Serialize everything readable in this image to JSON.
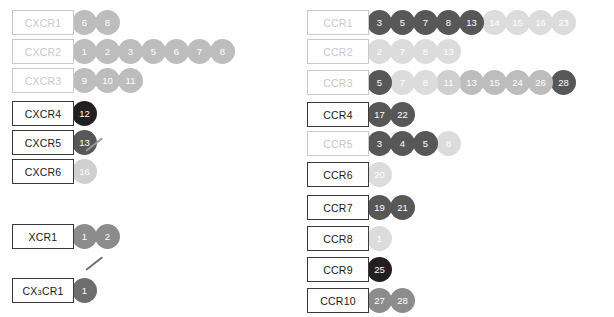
{
  "figure": {
    "palette": {
      "black": "#231f20",
      "dark": "#575757",
      "medium_dark": "#6e6e6e",
      "medium": "#8c8c8c",
      "light": "#bdbdbd",
      "lighter": "#cfcfcf",
      "lightest": "#dcdcdc",
      "box_border_active": "#3a3a3a",
      "box_border_muted": "#c9c9c9",
      "label_active": "#1a1a1a",
      "label_muted": "#c9c9c9",
      "ligand_text": "#ffffff",
      "background": "#ffffff"
    }
  },
  "chart_data": {
    "type": "diagram",
    "xlabel": "",
    "ylabel": "",
    "legend": [],
    "groups": [
      {
        "name": "CXC receptors",
        "column": "left",
        "rows": [
          {
            "receptor": "CXCR1",
            "muted": true,
            "ligands": [
              {
                "label": "6",
                "shade": "light"
              },
              {
                "label": "8",
                "shade": "light"
              }
            ]
          },
          {
            "receptor": "CXCR2",
            "muted": true,
            "ligands": [
              {
                "label": "1",
                "shade": "light"
              },
              {
                "label": "2",
                "shade": "light"
              },
              {
                "label": "3",
                "shade": "light"
              },
              {
                "label": "5",
                "shade": "light"
              },
              {
                "label": "6",
                "shade": "light"
              },
              {
                "label": "7",
                "shade": "light"
              },
              {
                "label": "8",
                "shade": "light"
              }
            ]
          },
          {
            "receptor": "CXCR3",
            "muted": true,
            "ligands": [
              {
                "label": "9",
                "shade": "light"
              },
              {
                "label": "10",
                "shade": "light"
              },
              {
                "label": "11",
                "shade": "light"
              }
            ]
          },
          {
            "receptor": "CXCR4",
            "muted": false,
            "ligands": [
              {
                "label": "12",
                "shade": "black"
              }
            ]
          },
          {
            "receptor": "CXCR5",
            "muted": false,
            "ligands": [
              {
                "label": "13",
                "shade": "dark"
              }
            ]
          },
          {
            "receptor": "CXCR6",
            "muted": false,
            "ligands": [
              {
                "label": "16",
                "shade": "lighter",
                "tail": true
              }
            ]
          }
        ]
      },
      {
        "name": "XC receptor",
        "column": "left",
        "rows": [
          {
            "receptor": "XCR1",
            "muted": false,
            "ligands": [
              {
                "label": "1",
                "shade": "medium"
              },
              {
                "label": "2",
                "shade": "medium"
              }
            ]
          }
        ]
      },
      {
        "name": "CX3C receptor",
        "column": "left",
        "rows": [
          {
            "receptor": "CX3CR1",
            "receptor_sub": "3",
            "receptor_pre": "CX",
            "receptor_post": "CR1",
            "muted": false,
            "ligands": [
              {
                "label": "1",
                "shade": "medium_dark",
                "tail": true,
                "tail_dark": true
              }
            ]
          }
        ]
      },
      {
        "name": "CC receptors",
        "column": "right",
        "rows": [
          {
            "receptor": "CCR1",
            "muted": true,
            "ligands": [
              {
                "label": "3",
                "shade": "dark"
              },
              {
                "label": "5",
                "shade": "dark"
              },
              {
                "label": "7",
                "shade": "dark"
              },
              {
                "label": "8",
                "shade": "dark"
              },
              {
                "label": "13",
                "shade": "dark"
              },
              {
                "label": "14",
                "shade": "lightest"
              },
              {
                "label": "15",
                "shade": "lightest"
              },
              {
                "label": "16",
                "shade": "lightest"
              },
              {
                "label": "23",
                "shade": "lightest"
              }
            ]
          },
          {
            "receptor": "CCR2",
            "muted": true,
            "ligands": [
              {
                "label": "2",
                "shade": "lightest"
              },
              {
                "label": "7",
                "shade": "lightest"
              },
              {
                "label": "8",
                "shade": "lightest"
              },
              {
                "label": "13",
                "shade": "lightest"
              }
            ]
          },
          {
            "receptor": "CCR3",
            "muted": true,
            "ligands": [
              {
                "label": "5",
                "shade": "dark"
              },
              {
                "label": "7",
                "shade": "lightest"
              },
              {
                "label": "8",
                "shade": "lightest"
              },
              {
                "label": "11",
                "shade": "lighter"
              },
              {
                "label": "13",
                "shade": "light"
              },
              {
                "label": "15",
                "shade": "light"
              },
              {
                "label": "24",
                "shade": "light"
              },
              {
                "label": "26",
                "shade": "light"
              },
              {
                "label": "28",
                "shade": "dark"
              }
            ]
          },
          {
            "receptor": "CCR4",
            "muted": false,
            "ligands": [
              {
                "label": "17",
                "shade": "dark"
              },
              {
                "label": "22",
                "shade": "dark"
              }
            ]
          },
          {
            "receptor": "CCR5",
            "muted": true,
            "ligands": [
              {
                "label": "3",
                "shade": "dark"
              },
              {
                "label": "4",
                "shade": "dark"
              },
              {
                "label": "5",
                "shade": "dark"
              },
              {
                "label": "8",
                "shade": "lightest"
              }
            ]
          },
          {
            "receptor": "CCR6",
            "muted": false,
            "ligands": [
              {
                "label": "20",
                "shade": "lightest"
              }
            ]
          },
          {
            "receptor": "CCR7",
            "muted": false,
            "ligands": [
              {
                "label": "19",
                "shade": "dark"
              },
              {
                "label": "21",
                "shade": "dark"
              }
            ]
          },
          {
            "receptor": "CCR8",
            "muted": false,
            "ligands": [
              {
                "label": "1",
                "shade": "lightest"
              }
            ]
          },
          {
            "receptor": "CCR9",
            "muted": false,
            "ligands": [
              {
                "label": "25",
                "shade": "black"
              }
            ]
          },
          {
            "receptor": "CCR10",
            "muted": false,
            "ligands": [
              {
                "label": "27",
                "shade": "medium"
              },
              {
                "label": "28",
                "shade": "medium"
              }
            ]
          }
        ]
      }
    ]
  },
  "layout": {
    "left_rows_y": [
      8,
      37,
      66,
      99,
      128,
      157,
      222,
      276
    ],
    "right_rows_y": [
      8,
      37,
      68,
      100,
      129,
      160,
      193,
      224,
      255,
      286
    ]
  }
}
